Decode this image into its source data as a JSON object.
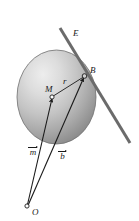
{
  "figure": {
    "background_color": "#ffffff",
    "width": 139,
    "height": 221
  },
  "labels": {
    "line_e": "E",
    "point_b": "B",
    "point_m": "M",
    "radius_r": "r",
    "vector_m": "m",
    "vector_b": "b",
    "origin_o": "O"
  },
  "colors": {
    "stroke": "#1a1a1a",
    "line_e_color": "#666666",
    "sphere_light": "#e8e8e8",
    "sphere_mid": "#b8b8b8",
    "sphere_dark": "#8a8a8a",
    "sphere_edge": "#6e6e6e"
  },
  "geometry": {
    "sphere": {
      "cx": 56.5,
      "cy": 97,
      "rx": 39.5,
      "ry": 47
    },
    "point_m": {
      "x": 52,
      "y": 97
    },
    "point_b": {
      "x": 84.5,
      "y": 76
    },
    "point_o": {
      "x": 27,
      "y": 206
    },
    "line_e": {
      "x1": 60,
      "y1": 28,
      "x2": 130,
      "y2": 143
    },
    "vector_m_label_pos": {
      "x": 28,
      "y": 144
    },
    "vector_b_label_pos": {
      "x": 57,
      "y": 148
    }
  }
}
